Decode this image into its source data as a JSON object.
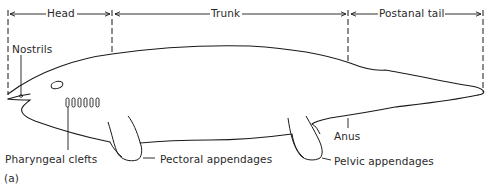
{
  "figure": {
    "panel_label": "(a)",
    "regions": [
      {
        "label": "Head"
      },
      {
        "label": "Trunk"
      },
      {
        "label": "Postanal tail"
      }
    ],
    "annotations": {
      "nostrils": "Nostrils",
      "pharyngeal_clefts": "Pharyngeal clefts",
      "pectoral_appendages": "Pectoral appendages",
      "anus": "Anus",
      "pelvic_appendages": "Pelvic appendages"
    },
    "colors": {
      "line": "#1a1a1a",
      "text": "#2a2a2a",
      "background": "#ffffff"
    }
  }
}
